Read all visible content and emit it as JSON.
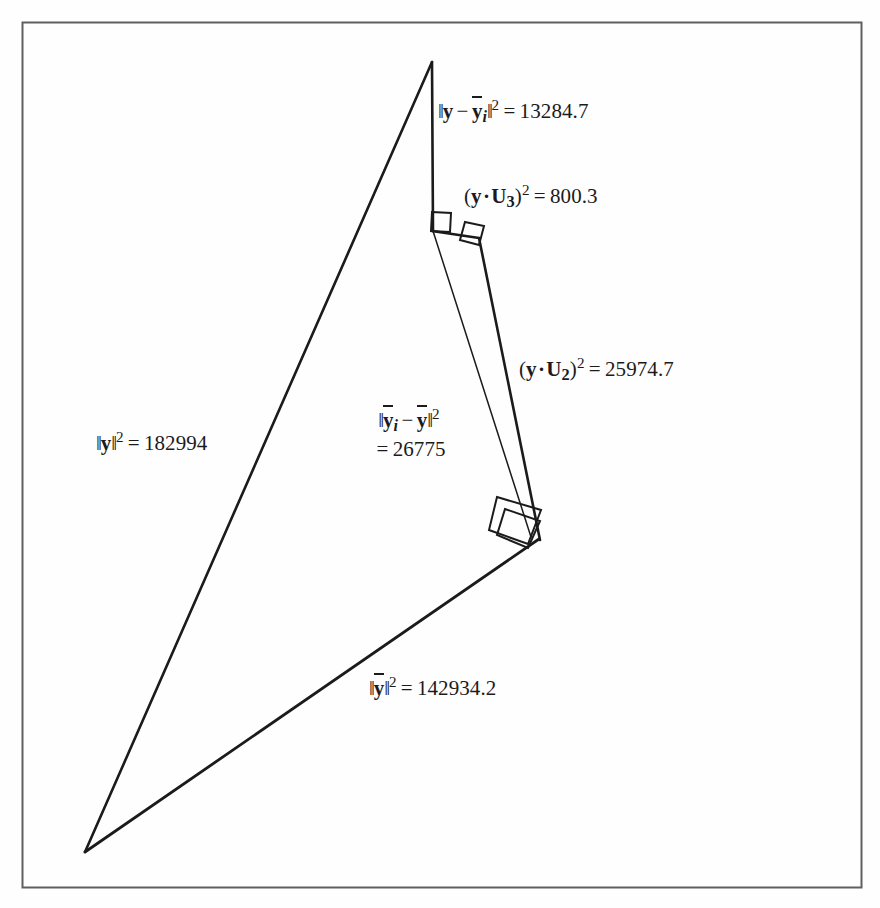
{
  "figure": {
    "background_color": "#fefefe",
    "ink_color": "#1b1b1b",
    "border_color": "#5a5a5a"
  },
  "labels": {
    "y_minus_ybar_i": {
      "name": "y-minus-ybar-i-label",
      "expression": "||y - ȳ_i||² = 13284.7",
      "value": "13284.7",
      "parts": {
        "norm_open": "‖",
        "var1": "y",
        "minus": "−",
        "var2": "y",
        "sub": "i",
        "norm_close": "‖",
        "sup": "2",
        "equals": "=",
        "number": "13284.7"
      }
    },
    "y_dot_u3": {
      "name": "y-dot-u3-label",
      "expression": "(y · U₃)² = 800.3",
      "value": "800.3",
      "parts": {
        "paren_open": "(",
        "var1": "y",
        "dot": "·",
        "var2": "U",
        "sub": "3",
        "paren_close": ")",
        "sup": "2",
        "equals": "=",
        "number": "800.3"
      }
    },
    "y_dot_u2": {
      "name": "y-dot-u2-label",
      "expression": "(y · U₂)² = 25974.7",
      "value": "25974.7",
      "parts": {
        "paren_open": "(",
        "var1": "y",
        "dot": "·",
        "var2": "U",
        "sub": "2",
        "paren_close": ")",
        "sup": "2",
        "equals": "=",
        "number": "25974.7"
      }
    },
    "ybar_i_minus_ybar": {
      "name": "ybar-i-minus-ybar-label",
      "expression": "||ȳ_i - ȳ||² = 26775",
      "value": "26775",
      "parts": {
        "norm_open": "‖",
        "var1": "y",
        "sub": "i",
        "minus": "−",
        "var2": "y",
        "norm_close": "‖",
        "sup": "2",
        "equals": "=",
        "number": "26775"
      }
    },
    "y_norm": {
      "name": "y-norm-label",
      "expression": "||y||² = 182994",
      "value": "182994",
      "parts": {
        "norm_open": "‖",
        "var1": "y",
        "norm_close": "‖",
        "sup": "2",
        "equals": "=",
        "number": "182994"
      }
    },
    "ybar_norm": {
      "name": "ybar-norm-label",
      "expression": "||ȳ||² = 142934.2",
      "value": "142934.2",
      "parts": {
        "norm_open": "‖",
        "var1": "y",
        "norm_close": "‖",
        "sup": "2",
        "equals": "=",
        "number": "142934.2"
      }
    }
  },
  "geometry": {
    "frame": {
      "x": 22,
      "y": 22,
      "width": 840,
      "height": 866
    },
    "vertices": {
      "apex": [
        432,
        62
      ],
      "bottom_left": [
        85,
        852
      ],
      "right": [
        538,
        538
      ],
      "foot_u3": [
        433,
        230
      ],
      "elbow": [
        478,
        237
      ]
    },
    "edges": [
      {
        "name": "y-edge",
        "from": "apex",
        "to": "bottom_left",
        "weight": "thick"
      },
      {
        "name": "ybar-edge",
        "from": "bottom_left",
        "to": "right",
        "weight": "thick"
      },
      {
        "name": "y-minus-ybar-i-edge",
        "from": "apex",
        "to": "foot_u3",
        "weight": "thick"
      },
      {
        "name": "u3-edge",
        "from": "foot_u3",
        "to": "elbow",
        "weight": "thick"
      },
      {
        "name": "u2-edge",
        "from": "elbow",
        "to": "right",
        "weight": "thick"
      },
      {
        "name": "ybar-i-minus-ybar-edge",
        "from": "foot_u3",
        "to": "right",
        "weight": "thin"
      }
    ],
    "right_angle_marks": [
      {
        "name": "right-angle-at-foot-u3",
        "x": 433,
        "y": 230
      },
      {
        "name": "right-angle-at-elbow",
        "x": 478,
        "y": 237
      },
      {
        "name": "right-angle-at-right-outer",
        "x": 538,
        "y": 538
      },
      {
        "name": "right-angle-at-right-inner",
        "x": 538,
        "y": 538
      }
    ]
  }
}
